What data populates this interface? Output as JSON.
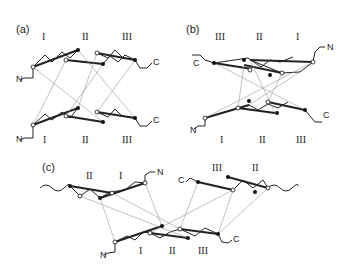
{
  "figure": {
    "panels": [
      {
        "label": "(a)",
        "top_strand_labels": [
          "I",
          "II",
          "III"
        ],
        "bottom_strand_labels": [
          "I",
          "II",
          "III"
        ],
        "termini": [
          "N",
          "C",
          "N",
          "C"
        ]
      },
      {
        "label": "(b)",
        "top_strand_labels": [
          "III",
          "II",
          "I"
        ],
        "bottom_strand_labels": [
          "I",
          "II",
          "III"
        ],
        "termini": [
          "C",
          "N",
          "N",
          "C"
        ]
      },
      {
        "label": "(c)",
        "top_left_strand_labels": [
          "II",
          "I"
        ],
        "top_right_strand_labels": [
          "III",
          "II"
        ],
        "bottom_strand_labels": [
          "I",
          "II",
          "III"
        ],
        "termini": [
          "N",
          "C",
          "N",
          "C"
        ]
      }
    ],
    "colors": {
      "line": "#222222",
      "dotted": "#888888",
      "background": "#ffffff"
    }
  }
}
